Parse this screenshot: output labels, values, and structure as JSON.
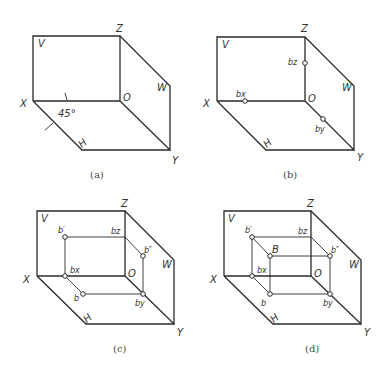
{
  "panels": [
    {
      "caption": "(a)",
      "labels": {
        "V": "V",
        "Z": "Z",
        "O": "O",
        "X": "X",
        "W": "W",
        "H": "H",
        "Y": "Y",
        "angle": "45°"
      }
    },
    {
      "caption": "(b)",
      "labels": {
        "V": "V",
        "Z": "Z",
        "O": "O",
        "X": "X",
        "W": "W",
        "H": "H",
        "Y": "Y",
        "bz": "bz",
        "bx": "bx",
        "by": "by"
      }
    },
    {
      "caption": "(c)",
      "labels": {
        "V": "V",
        "Z": "Z",
        "O": "O",
        "X": "X",
        "W": "W",
        "H": "H",
        "Y": "Y",
        "b_prime": "b′",
        "bz": "bz",
        "b_dprime": "b″",
        "bx": "bx",
        "b": "b",
        "by": "by"
      }
    },
    {
      "caption": "(d)",
      "labels": {
        "V": "V",
        "Z": "Z",
        "O": "O",
        "X": "X",
        "W": "W",
        "H": "H",
        "Y": "Y",
        "b_prime": "b′",
        "bz": "bz",
        "B": "B",
        "b_dprime": "b″",
        "bx": "bx",
        "b": "b",
        "by": "by"
      }
    }
  ]
}
